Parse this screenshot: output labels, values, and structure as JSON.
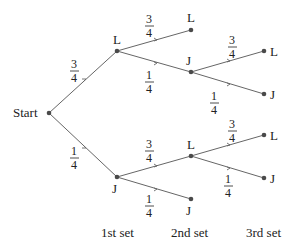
{
  "diagram": {
    "type": "probability-tree",
    "root_label": "Start",
    "column_labels": [
      "1st set",
      "2nd set",
      "3rd set"
    ],
    "nodes": [
      {
        "id": "start",
        "label": "Start",
        "x": 49,
        "y": 113
      },
      {
        "id": "L1",
        "label": "L",
        "x": 117,
        "y": 51
      },
      {
        "id": "J1",
        "label": "J",
        "x": 117,
        "y": 177
      },
      {
        "id": "L1L",
        "label": "L",
        "x": 191,
        "y": 30
      },
      {
        "id": "L1J",
        "label": "J",
        "x": 191,
        "y": 72
      },
      {
        "id": "J1L",
        "label": "L",
        "x": 191,
        "y": 156
      },
      {
        "id": "J1J",
        "label": "J",
        "x": 191,
        "y": 199
      },
      {
        "id": "L1JL",
        "label": "L",
        "x": 264,
        "y": 51
      },
      {
        "id": "L1JJ",
        "label": "J",
        "x": 264,
        "y": 94
      },
      {
        "id": "J1LL",
        "label": "L",
        "x": 264,
        "y": 135
      },
      {
        "id": "J1LJ",
        "label": "J",
        "x": 264,
        "y": 178
      }
    ],
    "edges": [
      {
        "from": "start",
        "to": "L1",
        "prob_num": "3",
        "prob_den": "4"
      },
      {
        "from": "start",
        "to": "J1",
        "prob_num": "1",
        "prob_den": "4"
      },
      {
        "from": "L1",
        "to": "L1L",
        "prob_num": "3",
        "prob_den": "4"
      },
      {
        "from": "L1",
        "to": "L1J",
        "prob_num": "1",
        "prob_den": "4"
      },
      {
        "from": "J1",
        "to": "J1L",
        "prob_num": "3",
        "prob_den": "4"
      },
      {
        "from": "J1",
        "to": "J1J",
        "prob_num": "1",
        "prob_den": "4"
      },
      {
        "from": "L1J",
        "to": "L1JL",
        "prob_num": "3",
        "prob_den": "4"
      },
      {
        "from": "L1J",
        "to": "L1JJ",
        "prob_num": "1",
        "prob_den": "4"
      },
      {
        "from": "J1L",
        "to": "J1LL",
        "prob_num": "3",
        "prob_den": "4"
      },
      {
        "from": "J1L",
        "to": "J1LJ",
        "prob_num": "1",
        "prob_den": "4"
      }
    ]
  },
  "labels": {
    "start": "Start",
    "L1": "L",
    "J1": "J",
    "L1L": "L",
    "L1J": "J",
    "J1L": "L",
    "J1J": "J",
    "L1JL": "L",
    "L1JJ": "J",
    "J1LL": "L",
    "J1LJ": "J",
    "col1": "1st set",
    "col2": "2nd set",
    "col3": "3rd set",
    "p_start_L1": {
      "num": "3",
      "den": "4"
    },
    "p_start_J1": {
      "num": "1",
      "den": "4"
    },
    "p_L1_L": {
      "num": "3",
      "den": "4"
    },
    "p_L1_J": {
      "num": "1",
      "den": "4"
    },
    "p_J1_L": {
      "num": "3",
      "den": "4"
    },
    "p_J1_J": {
      "num": "1",
      "den": "4"
    },
    "p_L1J_L": {
      "num": "3",
      "den": "4"
    },
    "p_L1J_J": {
      "num": "1",
      "den": "4"
    },
    "p_J1L_L": {
      "num": "3",
      "den": "4"
    },
    "p_J1L_J": {
      "num": "1",
      "den": "4"
    }
  },
  "colors": {
    "edge": "#666666",
    "node": "#4a4a4a",
    "text": "#222222",
    "background": "#ffffff"
  }
}
